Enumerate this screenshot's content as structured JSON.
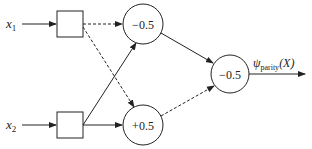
{
  "diagram": {
    "inputs": [
      {
        "name": "x",
        "sub": "1"
      },
      {
        "name": "x",
        "sub": "2"
      }
    ],
    "hidden_nodes": [
      {
        "threshold": "−0.5"
      },
      {
        "threshold": "+0.5"
      }
    ],
    "output_node": {
      "threshold": "−0.5"
    },
    "output_label": {
      "symbol": "ψ",
      "sub": "parity",
      "arg": "(X)"
    },
    "colors": {
      "stroke": "#222222",
      "background": "#ffffff"
    },
    "edge_styles": {
      "solid": "positive weight",
      "dashed": "negative weight"
    }
  }
}
